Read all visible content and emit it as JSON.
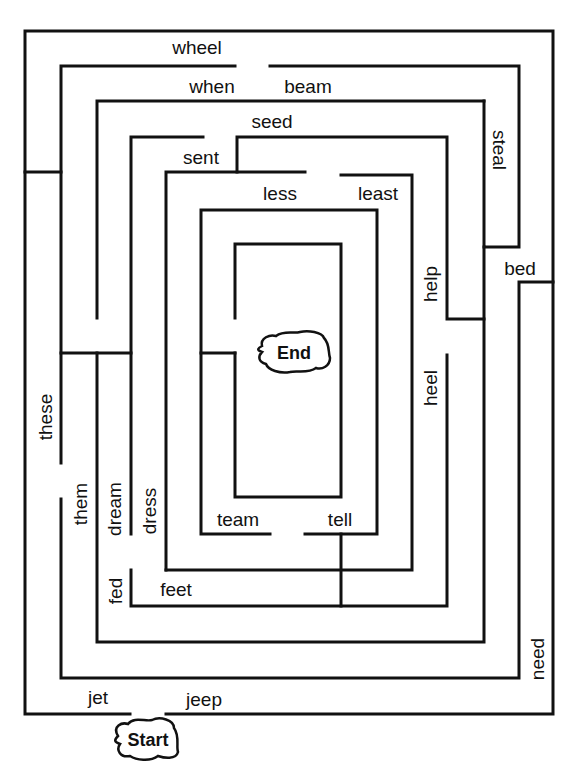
{
  "maze": {
    "start_label": "Start",
    "end_label": "End",
    "words": [
      {
        "id": "wheel",
        "text": "wheel",
        "x": 197,
        "y": 47,
        "orient": "h"
      },
      {
        "id": "when",
        "text": "when",
        "x": 212,
        "y": 86,
        "orient": "h"
      },
      {
        "id": "beam",
        "text": "beam",
        "x": 308,
        "y": 86,
        "orient": "h"
      },
      {
        "id": "seed",
        "text": "seed",
        "x": 272,
        "y": 121,
        "orient": "h"
      },
      {
        "id": "sent",
        "text": "sent",
        "x": 201,
        "y": 157,
        "orient": "h"
      },
      {
        "id": "less",
        "text": "less",
        "x": 280,
        "y": 193,
        "orient": "h"
      },
      {
        "id": "least",
        "text": "least",
        "x": 378,
        "y": 193,
        "orient": "h"
      },
      {
        "id": "steal",
        "text": "steal",
        "x": 499,
        "y": 150,
        "orient": "cw"
      },
      {
        "id": "bed",
        "text": "bed",
        "x": 520,
        "y": 268,
        "orient": "h"
      },
      {
        "id": "help",
        "text": "help",
        "x": 430,
        "y": 284,
        "orient": "ccw"
      },
      {
        "id": "heel",
        "text": "heel",
        "x": 430,
        "y": 388,
        "orient": "ccw"
      },
      {
        "id": "these",
        "text": "these",
        "x": 45,
        "y": 417,
        "orient": "ccw"
      },
      {
        "id": "them",
        "text": "them",
        "x": 80,
        "y": 504,
        "orient": "ccw"
      },
      {
        "id": "dream",
        "text": "dream",
        "x": 114,
        "y": 509,
        "orient": "ccw"
      },
      {
        "id": "dress",
        "text": "dress",
        "x": 149,
        "y": 511,
        "orient": "ccw"
      },
      {
        "id": "team",
        "text": "team",
        "x": 238,
        "y": 519,
        "orient": "h"
      },
      {
        "id": "tell",
        "text": "tell",
        "x": 340,
        "y": 519,
        "orient": "h"
      },
      {
        "id": "fed",
        "text": "fed",
        "x": 115,
        "y": 591,
        "orient": "ccw"
      },
      {
        "id": "feet",
        "text": "feet",
        "x": 176,
        "y": 589,
        "orient": "h"
      },
      {
        "id": "need",
        "text": "need",
        "x": 537,
        "y": 659,
        "orient": "ccw"
      },
      {
        "id": "jet",
        "text": "jet",
        "x": 98,
        "y": 697,
        "orient": "h"
      },
      {
        "id": "jeep",
        "text": "jeep",
        "x": 204,
        "y": 699,
        "orient": "h"
      }
    ]
  }
}
